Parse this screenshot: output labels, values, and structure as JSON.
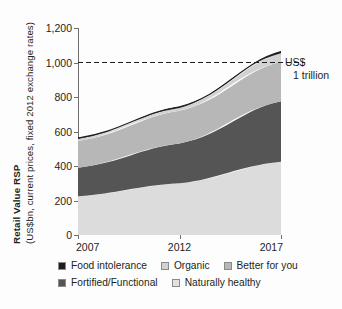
{
  "chart_data": {
    "type": "area",
    "title": "",
    "ylabel": "Retail Value RSP",
    "ylabel_sub": "(US$bn, current prices, fixed 2012 exchange rates)",
    "xlabel": "",
    "categories": [
      "2007",
      "2012",
      "2017"
    ],
    "x": [
      2007,
      2012,
      2017
    ],
    "xlim": [
      2007,
      2017
    ],
    "ylim": [
      0,
      1200
    ],
    "ytick_labels": [
      "0",
      "200",
      "400",
      "600",
      "800",
      "1,000",
      "1,200"
    ],
    "ytick_values": [
      0,
      200,
      400,
      600,
      800,
      1000,
      1200
    ],
    "grid": false,
    "legend_position": "bottom",
    "stacked": true,
    "stack_order_bottom_to_top": [
      "Naturally healthy",
      "Fortified/Functional",
      "Better for you",
      "Organic",
      "Food intolerance"
    ],
    "series": [
      {
        "name": "Naturally healthy",
        "values": [
          225,
          300,
          425
        ],
        "color": "#dcdcdc"
      },
      {
        "name": "Fortified/Functional",
        "values": [
          165,
          230,
          350
        ],
        "color": "#555555"
      },
      {
        "name": "Better for you",
        "values": [
          155,
          190,
          230
        ],
        "color": "#b7b7b7"
      },
      {
        "name": "Organic",
        "values": [
          12,
          16,
          48
        ],
        "color": "#d2d2d2"
      },
      {
        "name": "Food intolerance",
        "values": [
          5,
          7,
          10
        ],
        "color": "#1d1d1d"
      }
    ],
    "totals": [
      562,
      743,
      1063
    ],
    "annotations": [
      {
        "type": "reference-line",
        "value": 1000,
        "style": "dashed",
        "label_line1": "US$",
        "label_line2": "1 trillion"
      }
    ],
    "legend": [
      {
        "label": "Food intolerance",
        "color": "#1d1d1d"
      },
      {
        "label": "Organic",
        "color": "#d2d2d2"
      },
      {
        "label": "Better for you",
        "color": "#b7b7b7"
      },
      {
        "label": "Fortified/Functional",
        "color": "#555555"
      },
      {
        "label": "Naturally healthy",
        "color": "#e2e2e2"
      }
    ]
  }
}
